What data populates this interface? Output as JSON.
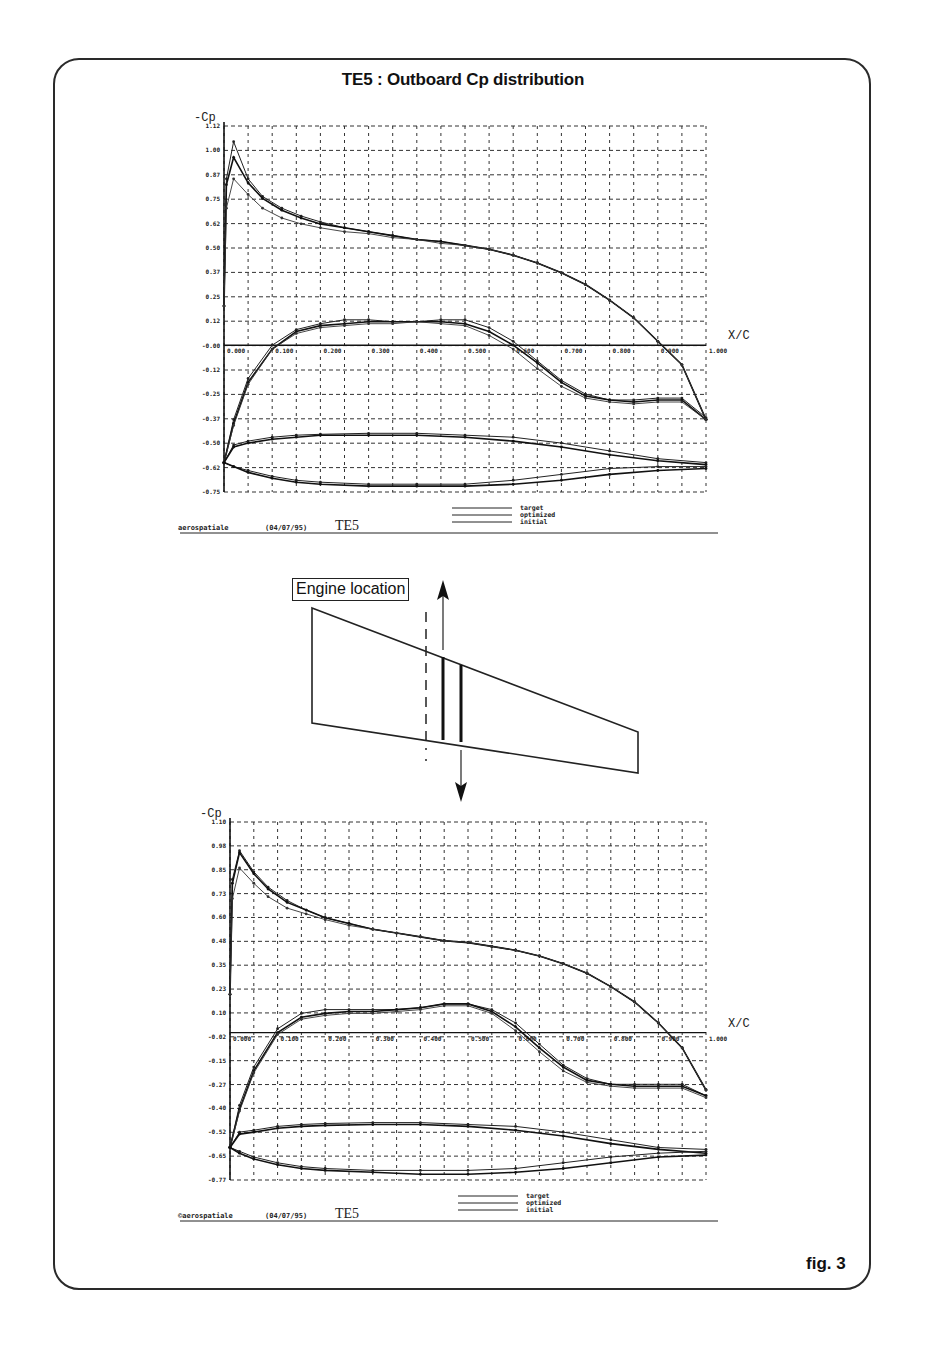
{
  "page": {
    "title": "TE5 : Outboard Cp distribution",
    "fig_label": "fig. 3"
  },
  "diagram": {
    "engine_label": "Engine location"
  },
  "chart_data": [
    {
      "type": "line",
      "title": "TE5 outboard Cp (upper plot)",
      "ylabel": "-Cp",
      "xlabel": "X/C",
      "xlim": [
        0.0,
        1.0
      ],
      "ylim": [
        -0.75,
        1.12
      ],
      "grid": true,
      "yticks": [
        "1.12",
        "1.00",
        "0.87",
        "0.75",
        "0.62",
        "0.50",
        "0.37",
        "0.25",
        "0.12",
        "-0.00",
        "-0.12",
        "-0.25",
        "-0.37",
        "-0.50",
        "-0.62",
        "-0.75"
      ],
      "xticks": [
        "0.000",
        "0.100",
        "0.200",
        "0.300",
        "0.400",
        "0.500",
        "0.600",
        "0.700",
        "0.800",
        "0.900",
        "1.000"
      ],
      "legend": [
        "target",
        "optimized",
        "initial"
      ],
      "footer": {
        "company": "aerospatiale",
        "date": "(04/07/95)",
        "case": "TE5"
      },
      "series": [
        {
          "name": "target",
          "surface": "upper-wing",
          "x": [
            0,
            0.005,
            0.02,
            0.05,
            0.08,
            0.12,
            0.16,
            0.2,
            0.25,
            0.3,
            0.35,
            0.4,
            0.45,
            0.5,
            0.55,
            0.6,
            0.65,
            0.7,
            0.75,
            0.8,
            0.85,
            0.9,
            0.95,
            1.0
          ],
          "y": [
            0.2,
            0.85,
            1.04,
            0.85,
            0.76,
            0.7,
            0.66,
            0.63,
            0.6,
            0.58,
            0.56,
            0.54,
            0.53,
            0.51,
            0.49,
            0.46,
            0.42,
            0.37,
            0.31,
            0.23,
            0.14,
            0.02,
            -0.1,
            -0.38
          ]
        },
        {
          "name": "optimized",
          "surface": "upper-wing",
          "x": [
            0,
            0.005,
            0.02,
            0.05,
            0.08,
            0.12,
            0.16,
            0.2,
            0.25,
            0.3,
            0.35,
            0.4,
            0.45,
            0.5,
            0.55,
            0.6,
            0.65,
            0.7,
            0.75,
            0.8,
            0.85,
            0.9,
            0.95,
            1.0
          ],
          "y": [
            0.2,
            0.82,
            0.96,
            0.83,
            0.75,
            0.69,
            0.65,
            0.62,
            0.6,
            0.58,
            0.56,
            0.54,
            0.53,
            0.51,
            0.49,
            0.46,
            0.42,
            0.37,
            0.31,
            0.23,
            0.14,
            0.02,
            -0.1,
            -0.38
          ]
        },
        {
          "name": "initial",
          "surface": "upper-wing",
          "x": [
            0,
            0.005,
            0.02,
            0.05,
            0.08,
            0.12,
            0.16,
            0.2,
            0.25,
            0.3,
            0.35,
            0.4,
            0.45,
            0.5,
            0.55,
            0.6,
            0.65,
            0.7,
            0.75,
            0.8,
            0.85,
            0.9,
            0.95,
            1.0
          ],
          "y": [
            0.2,
            0.7,
            0.85,
            0.77,
            0.7,
            0.65,
            0.62,
            0.6,
            0.58,
            0.57,
            0.55,
            0.54,
            0.52,
            0.51,
            0.49,
            0.46,
            0.42,
            0.37,
            0.31,
            0.23,
            0.14,
            0.02,
            -0.1,
            -0.38
          ]
        },
        {
          "name": "target",
          "surface": "lower-wing",
          "x": [
            0,
            0.02,
            0.05,
            0.1,
            0.15,
            0.2,
            0.25,
            0.3,
            0.35,
            0.4,
            0.45,
            0.5,
            0.55,
            0.6,
            0.65,
            0.7,
            0.75,
            0.8,
            0.85,
            0.9,
            0.95,
            1.0
          ],
          "y": [
            -0.6,
            -0.38,
            -0.17,
            0.0,
            0.08,
            0.11,
            0.13,
            0.13,
            0.12,
            0.12,
            0.13,
            0.13,
            0.09,
            0.02,
            -0.08,
            -0.18,
            -0.25,
            -0.28,
            -0.28,
            -0.27,
            -0.27,
            -0.37
          ]
        },
        {
          "name": "optimized",
          "surface": "lower-wing",
          "x": [
            0,
            0.02,
            0.05,
            0.1,
            0.15,
            0.2,
            0.25,
            0.3,
            0.35,
            0.4,
            0.45,
            0.5,
            0.55,
            0.6,
            0.65,
            0.7,
            0.75,
            0.8,
            0.85,
            0.9,
            0.95,
            1.0
          ],
          "y": [
            -0.6,
            -0.4,
            -0.19,
            -0.02,
            0.07,
            0.1,
            0.11,
            0.12,
            0.12,
            0.12,
            0.12,
            0.11,
            0.07,
            0.0,
            -0.09,
            -0.19,
            -0.26,
            -0.28,
            -0.29,
            -0.28,
            -0.28,
            -0.38
          ]
        },
        {
          "name": "initial",
          "surface": "lower-wing",
          "x": [
            0,
            0.02,
            0.05,
            0.1,
            0.15,
            0.2,
            0.25,
            0.3,
            0.35,
            0.4,
            0.45,
            0.5,
            0.55,
            0.6,
            0.65,
            0.7,
            0.75,
            0.8,
            0.85,
            0.9,
            0.95,
            1.0
          ],
          "y": [
            -0.6,
            -0.41,
            -0.2,
            -0.02,
            0.06,
            0.09,
            0.1,
            0.11,
            0.11,
            0.12,
            0.11,
            0.1,
            0.05,
            -0.02,
            -0.12,
            -0.21,
            -0.27,
            -0.29,
            -0.3,
            -0.29,
            -0.29,
            -0.38
          ]
        },
        {
          "name": "target",
          "surface": "lower-loop-top",
          "x": [
            0,
            0.02,
            0.05,
            0.1,
            0.15,
            0.2,
            0.3,
            0.4,
            0.5,
            0.6,
            0.7,
            0.8,
            0.9,
            1.0
          ],
          "y": [
            -0.6,
            -0.51,
            -0.49,
            -0.47,
            -0.46,
            -0.455,
            -0.45,
            -0.45,
            -0.46,
            -0.47,
            -0.5,
            -0.54,
            -0.58,
            -0.6
          ]
        },
        {
          "name": "optimized",
          "surface": "lower-loop-top",
          "x": [
            0,
            0.02,
            0.05,
            0.1,
            0.15,
            0.2,
            0.3,
            0.4,
            0.5,
            0.6,
            0.7,
            0.8,
            0.9,
            1.0
          ],
          "y": [
            -0.6,
            -0.52,
            -0.5,
            -0.48,
            -0.47,
            -0.46,
            -0.46,
            -0.46,
            -0.47,
            -0.49,
            -0.52,
            -0.56,
            -0.59,
            -0.61
          ]
        },
        {
          "name": "target",
          "surface": "lower-loop-bottom",
          "x": [
            0,
            0.02,
            0.05,
            0.1,
            0.15,
            0.2,
            0.3,
            0.4,
            0.5,
            0.6,
            0.7,
            0.8,
            0.9,
            1.0
          ],
          "y": [
            -0.6,
            -0.62,
            -0.64,
            -0.67,
            -0.69,
            -0.7,
            -0.71,
            -0.71,
            -0.71,
            -0.69,
            -0.66,
            -0.63,
            -0.62,
            -0.62
          ]
        },
        {
          "name": "optimized",
          "surface": "lower-loop-bottom",
          "x": [
            0,
            0.02,
            0.05,
            0.1,
            0.15,
            0.2,
            0.3,
            0.4,
            0.5,
            0.6,
            0.7,
            0.8,
            0.9,
            1.0
          ],
          "y": [
            -0.6,
            -0.62,
            -0.65,
            -0.68,
            -0.7,
            -0.71,
            -0.72,
            -0.72,
            -0.72,
            -0.71,
            -0.69,
            -0.66,
            -0.64,
            -0.63
          ]
        }
      ]
    },
    {
      "type": "line",
      "title": "TE5 outboard Cp (lower plot)",
      "ylabel": "-Cp",
      "xlabel": "X/C",
      "xlim": [
        0.0,
        1.0
      ],
      "ylim": [
        -0.77,
        1.1
      ],
      "grid": true,
      "yticks": [
        "1.10",
        "0.98",
        "0.85",
        "0.73",
        "0.60",
        "0.48",
        "0.35",
        "0.23",
        "0.10",
        "-0.02",
        "-0.15",
        "-0.27",
        "-0.40",
        "-0.52",
        "-0.65",
        "-0.77"
      ],
      "xticks": [
        "0.000",
        "0.100",
        "0.200",
        "0.300",
        "0.400",
        "0.500",
        "0.600",
        "0.700",
        "0.800",
        "0.900",
        "1.000"
      ],
      "legend": [
        "target",
        "optimized",
        "initial"
      ],
      "footer": {
        "company": "©aerospatiale",
        "date": "(04/07/95)",
        "case": "TE5"
      },
      "series": [
        {
          "name": "target",
          "surface": "upper-wing",
          "x": [
            0,
            0.005,
            0.02,
            0.05,
            0.08,
            0.12,
            0.16,
            0.2,
            0.25,
            0.3,
            0.35,
            0.4,
            0.45,
            0.5,
            0.55,
            0.6,
            0.65,
            0.7,
            0.75,
            0.8,
            0.85,
            0.9,
            0.95,
            1.0
          ],
          "y": [
            0.2,
            0.8,
            0.95,
            0.84,
            0.76,
            0.69,
            0.64,
            0.6,
            0.57,
            0.54,
            0.52,
            0.5,
            0.48,
            0.47,
            0.45,
            0.43,
            0.4,
            0.36,
            0.31,
            0.24,
            0.16,
            0.05,
            -0.08,
            -0.3
          ]
        },
        {
          "name": "optimized",
          "surface": "upper-wing",
          "x": [
            0,
            0.005,
            0.02,
            0.05,
            0.08,
            0.12,
            0.16,
            0.2,
            0.25,
            0.3,
            0.35,
            0.4,
            0.45,
            0.5,
            0.55,
            0.6,
            0.65,
            0.7,
            0.75,
            0.8,
            0.85,
            0.9,
            0.95,
            1.0
          ],
          "y": [
            0.2,
            0.78,
            0.94,
            0.83,
            0.75,
            0.68,
            0.64,
            0.6,
            0.57,
            0.54,
            0.52,
            0.5,
            0.48,
            0.47,
            0.45,
            0.43,
            0.4,
            0.36,
            0.31,
            0.24,
            0.16,
            0.05,
            -0.08,
            -0.3
          ]
        },
        {
          "name": "initial",
          "surface": "upper-wing",
          "x": [
            0,
            0.005,
            0.02,
            0.05,
            0.08,
            0.12,
            0.16,
            0.2,
            0.25,
            0.3,
            0.35,
            0.4,
            0.45,
            0.5,
            0.55,
            0.6,
            0.65,
            0.7,
            0.75,
            0.8,
            0.85,
            0.9,
            0.95,
            1.0
          ],
          "y": [
            0.2,
            0.7,
            0.86,
            0.78,
            0.71,
            0.65,
            0.62,
            0.59,
            0.56,
            0.54,
            0.52,
            0.5,
            0.48,
            0.47,
            0.45,
            0.43,
            0.4,
            0.36,
            0.31,
            0.24,
            0.16,
            0.05,
            -0.08,
            -0.3
          ]
        },
        {
          "name": "target",
          "surface": "lower-wing",
          "x": [
            0,
            0.02,
            0.05,
            0.1,
            0.15,
            0.2,
            0.25,
            0.3,
            0.35,
            0.4,
            0.45,
            0.5,
            0.55,
            0.6,
            0.65,
            0.7,
            0.75,
            0.8,
            0.85,
            0.9,
            0.95,
            1.0
          ],
          "y": [
            -0.6,
            -0.38,
            -0.18,
            0.02,
            0.1,
            0.12,
            0.12,
            0.12,
            0.12,
            0.13,
            0.15,
            0.15,
            0.12,
            0.05,
            -0.06,
            -0.17,
            -0.24,
            -0.27,
            -0.27,
            -0.27,
            -0.27,
            -0.33
          ]
        },
        {
          "name": "optimized",
          "surface": "lower-wing",
          "x": [
            0,
            0.02,
            0.05,
            0.1,
            0.15,
            0.2,
            0.25,
            0.3,
            0.35,
            0.4,
            0.45,
            0.5,
            0.55,
            0.6,
            0.65,
            0.7,
            0.75,
            0.8,
            0.85,
            0.9,
            0.95,
            1.0
          ],
          "y": [
            -0.6,
            -0.4,
            -0.2,
            0.0,
            0.08,
            0.1,
            0.11,
            0.11,
            0.12,
            0.13,
            0.15,
            0.15,
            0.11,
            0.03,
            -0.08,
            -0.18,
            -0.25,
            -0.27,
            -0.28,
            -0.28,
            -0.28,
            -0.33
          ]
        },
        {
          "name": "initial",
          "surface": "lower-wing",
          "x": [
            0,
            0.02,
            0.05,
            0.1,
            0.15,
            0.2,
            0.25,
            0.3,
            0.35,
            0.4,
            0.45,
            0.5,
            0.55,
            0.6,
            0.65,
            0.7,
            0.75,
            0.8,
            0.85,
            0.9,
            0.95,
            1.0
          ],
          "y": [
            -0.6,
            -0.41,
            -0.21,
            -0.01,
            0.07,
            0.09,
            0.1,
            0.1,
            0.11,
            0.12,
            0.14,
            0.14,
            0.1,
            0.01,
            -0.1,
            -0.2,
            -0.26,
            -0.28,
            -0.29,
            -0.29,
            -0.29,
            -0.34
          ]
        },
        {
          "name": "target",
          "surface": "lower-loop-top",
          "x": [
            0,
            0.02,
            0.05,
            0.1,
            0.15,
            0.2,
            0.3,
            0.4,
            0.5,
            0.6,
            0.7,
            0.8,
            0.9,
            1.0
          ],
          "y": [
            -0.6,
            -0.52,
            -0.51,
            -0.49,
            -0.48,
            -0.475,
            -0.47,
            -0.47,
            -0.48,
            -0.49,
            -0.52,
            -0.56,
            -0.6,
            -0.61
          ]
        },
        {
          "name": "optimized",
          "surface": "lower-loop-top",
          "x": [
            0,
            0.02,
            0.05,
            0.1,
            0.15,
            0.2,
            0.3,
            0.4,
            0.5,
            0.6,
            0.7,
            0.8,
            0.9,
            1.0
          ],
          "y": [
            -0.6,
            -0.53,
            -0.52,
            -0.5,
            -0.49,
            -0.485,
            -0.48,
            -0.48,
            -0.49,
            -0.51,
            -0.54,
            -0.58,
            -0.61,
            -0.63
          ]
        },
        {
          "name": "target",
          "surface": "lower-loop-bottom",
          "x": [
            0,
            0.02,
            0.05,
            0.1,
            0.15,
            0.2,
            0.3,
            0.4,
            0.5,
            0.6,
            0.7,
            0.8,
            0.9,
            1.0
          ],
          "y": [
            -0.6,
            -0.62,
            -0.65,
            -0.68,
            -0.7,
            -0.71,
            -0.72,
            -0.72,
            -0.72,
            -0.71,
            -0.68,
            -0.65,
            -0.63,
            -0.62
          ]
        },
        {
          "name": "optimized",
          "surface": "lower-loop-bottom",
          "x": [
            0,
            0.02,
            0.05,
            0.1,
            0.15,
            0.2,
            0.3,
            0.4,
            0.5,
            0.6,
            0.7,
            0.8,
            0.9,
            1.0
          ],
          "y": [
            -0.6,
            -0.63,
            -0.66,
            -0.69,
            -0.71,
            -0.72,
            -0.73,
            -0.74,
            -0.74,
            -0.73,
            -0.71,
            -0.68,
            -0.65,
            -0.64
          ]
        }
      ]
    }
  ]
}
